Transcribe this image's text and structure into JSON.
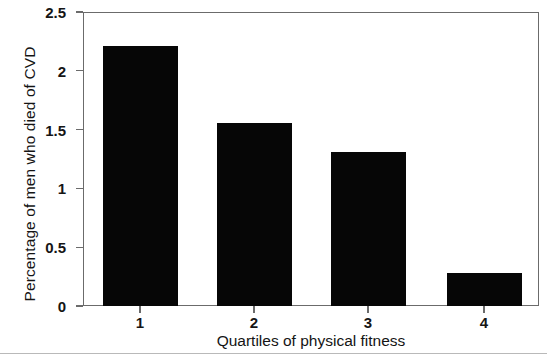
{
  "chart_data": {
    "type": "bar",
    "title": "",
    "categories": [
      "1",
      "2",
      "3",
      "4"
    ],
    "values": [
      2.21,
      1.56,
      1.31,
      0.28
    ],
    "xlabel": "Quartiles of physical fitness",
    "ylabel": "Percentage of men who died of CVD",
    "ylim": [
      0,
      2.5
    ],
    "yticks": [
      "0",
      "0.5",
      "1",
      "1.5",
      "2",
      "2.5"
    ],
    "ytick_values": [
      0,
      0.5,
      1,
      1.5,
      2,
      2.5
    ],
    "xticks": [
      "1",
      "2",
      "3",
      "4"
    ],
    "grid": false,
    "legend": null,
    "bar_color": "#060606",
    "axis_color": "#6b6b6b",
    "background": "#ffffff"
  }
}
